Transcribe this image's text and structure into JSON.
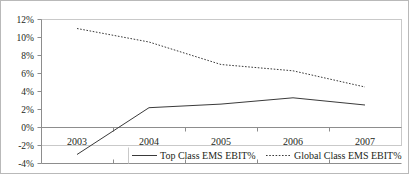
{
  "chart_data": {
    "type": "line",
    "title": "",
    "subtitle": "",
    "xlabel": "",
    "ylabel": "",
    "categories": [
      "2003",
      "2004",
      "2005",
      "2006",
      "2007"
    ],
    "ylim": [
      -4,
      12
    ],
    "y_ticks": [
      12,
      10,
      8,
      6,
      4,
      2,
      0,
      -2,
      -4
    ],
    "y_tick_labels": [
      "12%",
      "10%",
      "8%",
      "6%",
      "4%",
      "2%",
      "0%",
      "-2%",
      "-4%"
    ],
    "grid": false,
    "legend_position": "bottom",
    "series": [
      {
        "name": "Top Class EMS EBIT%",
        "style": "solid",
        "color": "#3a3a3a",
        "values": [
          -3.0,
          2.2,
          2.6,
          3.3,
          2.5
        ]
      },
      {
        "name": "Global Class EMS EBIT%",
        "style": "dotted",
        "color": "#3a3a3a",
        "values": [
          11.0,
          9.5,
          7.0,
          6.3,
          4.5
        ]
      }
    ]
  },
  "legend": {
    "items": [
      {
        "label": "Top Class EMS EBIT%",
        "marker": "solid-line-marker"
      },
      {
        "label": "Global Class EMS EBIT%",
        "marker": "dotted-line-marker"
      }
    ]
  }
}
